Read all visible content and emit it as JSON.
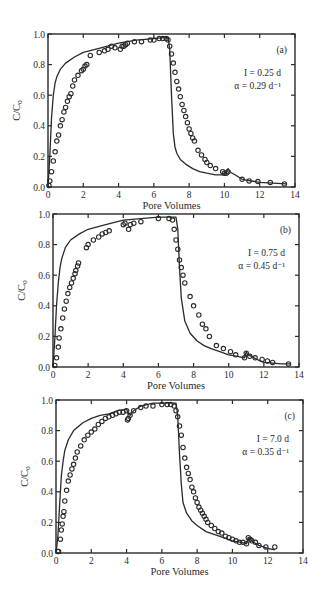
{
  "figure": {
    "panels_count": 3
  },
  "chart_data": [
    {
      "type": "scatter",
      "panel_label": "(a)",
      "title": "",
      "xlabel": "Pore Volumes",
      "ylabel": "C/C0",
      "xlim": [
        0,
        14
      ],
      "ylim": [
        0,
        1.0
      ],
      "xticks": [
        0,
        2,
        4,
        6,
        8,
        10,
        12,
        14
      ],
      "yticks": [
        0.0,
        0.2,
        0.4,
        0.6,
        0.8,
        1.0
      ],
      "xtick_labels": [
        "0",
        "2",
        "4",
        "6",
        "8",
        "10",
        "12",
        "14"
      ],
      "ytick_labels": [
        "0.0",
        "0.2",
        "0.4",
        "0.6",
        "0.8",
        "1.0"
      ],
      "grid": false,
      "annotations": [
        {
          "text": "(a)"
        },
        {
          "text": "I = 0.25 d"
        },
        {
          "text": "α = 0.29 d⁻¹"
        }
      ],
      "frame_px": {
        "left": 48,
        "top": 34,
        "right": 295,
        "bottom": 187
      },
      "series": [
        {
          "name": "observed",
          "style": "open-circle",
          "x": [
            0.05,
            0.1,
            0.2,
            0.3,
            0.4,
            0.5,
            0.6,
            0.7,
            0.8,
            0.9,
            1.0,
            1.1,
            1.2,
            1.3,
            1.4,
            1.5,
            1.7,
            1.9,
            2.0,
            2.1,
            2.2,
            2.4,
            2.9,
            3.2,
            3.4,
            3.6,
            3.8,
            4.1,
            4.2,
            4.3,
            4.4,
            4.5,
            4.9,
            5.3,
            5.8,
            6.0,
            6.3,
            6.5,
            6.7,
            6.8,
            6.9,
            7.0,
            7.1,
            7.2,
            7.3,
            7.4,
            7.5,
            7.6,
            7.7,
            7.8,
            7.9,
            8.0,
            8.1,
            8.2,
            8.3,
            8.5,
            8.7,
            8.9,
            9.0,
            9.2,
            9.5,
            9.9,
            10.0,
            10.1,
            10.2,
            11.0,
            11.4,
            11.9,
            12.6,
            13.4
          ],
          "y": [
            0.01,
            0.04,
            0.1,
            0.17,
            0.23,
            0.3,
            0.34,
            0.4,
            0.44,
            0.49,
            0.52,
            0.56,
            0.59,
            0.61,
            0.66,
            0.7,
            0.73,
            0.76,
            0.77,
            0.79,
            0.8,
            0.86,
            0.88,
            0.89,
            0.9,
            0.92,
            0.91,
            0.9,
            0.92,
            0.92,
            0.93,
            0.94,
            0.95,
            0.95,
            0.96,
            0.96,
            0.97,
            0.97,
            0.97,
            0.96,
            0.92,
            0.87,
            0.81,
            0.75,
            0.69,
            0.64,
            0.59,
            0.54,
            0.5,
            0.46,
            0.42,
            0.38,
            0.35,
            0.32,
            0.3,
            0.24,
            0.21,
            0.18,
            0.16,
            0.14,
            0.12,
            0.1,
            0.09,
            0.09,
            0.1,
            0.05,
            0.04,
            0.035,
            0.03,
            0.02
          ]
        },
        {
          "name": "model",
          "style": "line",
          "x": [
            0,
            0.1,
            0.2,
            0.3,
            0.4,
            0.5,
            0.7,
            1.0,
            1.5,
            2.0,
            3.0,
            4.0,
            5.0,
            6.0,
            6.8,
            6.9,
            7.0,
            7.1,
            7.2,
            7.3,
            7.5,
            7.8,
            8.2,
            8.6,
            9.0,
            9.5,
            10.0,
            10.1,
            10.2,
            10.3,
            10.6,
            11.0,
            12.0,
            13.5
          ],
          "y": [
            0.0,
            0.2,
            0.45,
            0.6,
            0.68,
            0.72,
            0.77,
            0.81,
            0.85,
            0.88,
            0.91,
            0.94,
            0.96,
            0.97,
            0.98,
            0.9,
            0.6,
            0.35,
            0.26,
            0.22,
            0.18,
            0.15,
            0.12,
            0.1,
            0.09,
            0.08,
            0.08,
            0.1,
            0.12,
            0.1,
            0.08,
            0.05,
            0.03,
            0.02
          ]
        }
      ]
    },
    {
      "type": "scatter",
      "panel_label": "(b)",
      "title": "",
      "xlabel": "Pore Volumes",
      "ylabel": "C/C0",
      "xlim": [
        0,
        14
      ],
      "ylim": [
        0,
        1.0
      ],
      "xticks": [
        0,
        2,
        4,
        6,
        8,
        10,
        12,
        14
      ],
      "yticks": [
        0.0,
        0.2,
        0.4,
        0.6,
        0.8,
        1.0
      ],
      "xtick_labels": [
        "0",
        "2",
        "4",
        "6",
        "8",
        "10",
        "12",
        "14"
      ],
      "ytick_labels": [
        "0.0",
        "0.2",
        "0.4",
        "0.6",
        "0.8",
        "1.0"
      ],
      "grid": false,
      "annotations": [
        {
          "text": "(b)"
        },
        {
          "text": "I = 0.75 d"
        },
        {
          "text": "α = 0.45 d⁻¹"
        }
      ],
      "frame_px": {
        "left": 53,
        "top": 214,
        "right": 299,
        "bottom": 367
      },
      "series": [
        {
          "name": "observed",
          "style": "open-circle",
          "x": [
            0.1,
            0.2,
            0.3,
            0.35,
            0.45,
            0.55,
            0.65,
            0.75,
            0.85,
            0.95,
            1.05,
            1.15,
            1.25,
            1.3,
            1.4,
            1.45,
            1.9,
            2.0,
            2.3,
            2.6,
            2.8,
            3.0,
            3.2,
            4.0,
            4.1,
            4.3,
            4.4,
            4.6,
            5.0,
            6.0,
            6.6,
            6.8,
            6.9,
            7.0,
            7.1,
            7.2,
            7.3,
            7.4,
            7.5,
            7.8,
            8.0,
            8.3,
            8.5,
            8.7,
            8.9,
            9.3,
            9.7,
            10.1,
            10.4,
            10.9,
            11.0,
            11.2,
            11.5,
            11.9,
            12.2,
            12.5,
            13.4
          ],
          "y": [
            0.01,
            0.06,
            0.13,
            0.19,
            0.25,
            0.32,
            0.38,
            0.43,
            0.48,
            0.52,
            0.55,
            0.58,
            0.61,
            0.63,
            0.66,
            0.68,
            0.78,
            0.8,
            0.83,
            0.85,
            0.87,
            0.88,
            0.89,
            0.93,
            0.94,
            0.9,
            0.93,
            0.94,
            0.95,
            0.97,
            0.97,
            0.96,
            0.9,
            0.83,
            0.77,
            0.7,
            0.65,
            0.6,
            0.55,
            0.46,
            0.4,
            0.34,
            0.28,
            0.25,
            0.2,
            0.14,
            0.12,
            0.1,
            0.08,
            0.06,
            0.09,
            0.07,
            0.06,
            0.05,
            0.04,
            0.03,
            0.02
          ]
        },
        {
          "name": "model",
          "style": "line",
          "x": [
            0,
            0.1,
            0.2,
            0.3,
            0.4,
            0.5,
            0.7,
            1.0,
            1.5,
            2.0,
            3.0,
            4.0,
            5.0,
            6.0,
            7.0,
            7.1,
            7.2,
            7.3,
            7.5,
            7.8,
            8.2,
            8.6,
            9.0,
            9.5,
            10.0,
            10.5,
            10.9,
            11.0,
            11.1,
            11.3,
            11.6,
            12.0,
            13.0,
            13.5
          ],
          "y": [
            0.0,
            0.18,
            0.4,
            0.55,
            0.65,
            0.71,
            0.78,
            0.83,
            0.87,
            0.9,
            0.93,
            0.96,
            0.97,
            0.98,
            0.98,
            0.9,
            0.65,
            0.45,
            0.3,
            0.22,
            0.17,
            0.14,
            0.12,
            0.1,
            0.08,
            0.07,
            0.06,
            0.1,
            0.08,
            0.07,
            0.05,
            0.03,
            0.02,
            0.02
          ]
        }
      ]
    },
    {
      "type": "scatter",
      "panel_label": "(c)",
      "title": "",
      "xlabel": "Pore Volumes",
      "ylabel": "C/C0",
      "xlim": [
        0,
        14
      ],
      "ylim": [
        0,
        1.0
      ],
      "xticks": [
        0,
        2,
        4,
        6,
        8,
        10,
        12,
        14
      ],
      "yticks": [
        0.0,
        0.2,
        0.4,
        0.6,
        0.8,
        1.0
      ],
      "xtick_labels": [
        "0",
        "2",
        "4",
        "6",
        "8",
        "10",
        "12",
        "14"
      ],
      "ytick_labels": [
        "0.0",
        "0.2",
        "0.4",
        "0.6",
        "0.8",
        "1.0"
      ],
      "grid": false,
      "annotations": [
        {
          "text": "(c)"
        },
        {
          "text": "I = 7.0 d"
        },
        {
          "text": "α = 0.35 d⁻¹"
        }
      ],
      "frame_px": {
        "left": 56,
        "top": 400,
        "right": 303,
        "bottom": 553
      },
      "series": [
        {
          "name": "observed",
          "style": "open-circle",
          "x": [
            0.1,
            0.15,
            0.25,
            0.3,
            0.35,
            0.4,
            0.45,
            0.5,
            0.6,
            0.7,
            0.8,
            0.9,
            1.0,
            1.1,
            1.2,
            1.4,
            1.6,
            1.8,
            2.0,
            2.2,
            2.4,
            2.6,
            2.8,
            3.0,
            3.2,
            3.4,
            3.6,
            3.8,
            4.0,
            4.05,
            4.1,
            4.2,
            4.4,
            4.8,
            5.1,
            5.5,
            6.0,
            6.3,
            6.5,
            6.7,
            6.8,
            6.9,
            7.0,
            7.1,
            7.2,
            7.3,
            7.4,
            7.5,
            7.6,
            7.7,
            7.8,
            7.9,
            8.0,
            8.1,
            8.2,
            8.3,
            8.4,
            8.5,
            8.6,
            8.8,
            9.0,
            9.2,
            9.4,
            9.6,
            9.8,
            10.0,
            10.2,
            10.4,
            10.6,
            10.8,
            10.9,
            11.0,
            11.1,
            11.3,
            11.5,
            11.9,
            12.4
          ],
          "y": [
            0.01,
            0.01,
            0.09,
            0.15,
            0.19,
            0.24,
            0.27,
            0.34,
            0.41,
            0.47,
            0.51,
            0.55,
            0.58,
            0.62,
            0.66,
            0.7,
            0.74,
            0.77,
            0.79,
            0.81,
            0.84,
            0.86,
            0.88,
            0.89,
            0.9,
            0.91,
            0.92,
            0.92,
            0.93,
            0.87,
            0.88,
            0.9,
            0.93,
            0.95,
            0.96,
            0.96,
            0.97,
            0.97,
            0.97,
            0.96,
            0.93,
            0.89,
            0.83,
            0.77,
            0.69,
            0.62,
            0.56,
            0.52,
            0.48,
            0.43,
            0.4,
            0.36,
            0.33,
            0.3,
            0.28,
            0.26,
            0.24,
            0.22,
            0.2,
            0.18,
            0.16,
            0.14,
            0.13,
            0.11,
            0.1,
            0.09,
            0.08,
            0.07,
            0.07,
            0.06,
            0.1,
            0.09,
            0.08,
            0.07,
            0.05,
            0.04,
            0.04
          ]
        },
        {
          "name": "model",
          "style": "line",
          "x": [
            0,
            0.1,
            0.2,
            0.3,
            0.4,
            0.5,
            0.7,
            1.0,
            1.5,
            2.0,
            2.5,
            3.0,
            3.5,
            4.0,
            4.1,
            4.2,
            4.4,
            4.8,
            5.5,
            6.0,
            6.8,
            6.9,
            7.0,
            7.1,
            7.2,
            7.4,
            7.7,
            8.0,
            8.5,
            9.0,
            9.5,
            10.0,
            10.5,
            10.8,
            10.9,
            11.0,
            11.2,
            11.5,
            12.0,
            12.4
          ],
          "y": [
            0.0,
            0.1,
            0.3,
            0.5,
            0.6,
            0.67,
            0.74,
            0.8,
            0.85,
            0.88,
            0.9,
            0.91,
            0.93,
            0.94,
            0.91,
            0.9,
            0.93,
            0.96,
            0.98,
            0.98,
            0.98,
            0.9,
            0.65,
            0.45,
            0.33,
            0.26,
            0.21,
            0.18,
            0.14,
            0.12,
            0.1,
            0.08,
            0.07,
            0.06,
            0.1,
            0.09,
            0.07,
            0.05,
            0.03,
            0.02
          ]
        }
      ]
    }
  ]
}
